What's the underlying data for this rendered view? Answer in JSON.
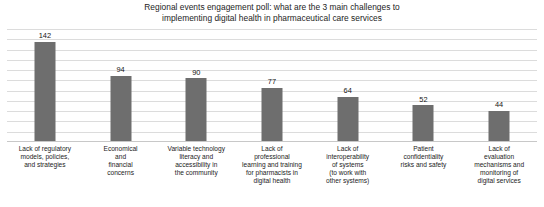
{
  "chart_data": {
    "type": "bar",
    "title": "Regional events engagement poll: what are the 3 main challenges to implementing digital health in pharmaceutical care services",
    "title_lines": [
      "Regional events engagement poll: what are the 3 main challenges to",
      "implementing digital health in pharmaceutical care services"
    ],
    "xlabel": "",
    "ylabel": "",
    "ylim": [
      0,
      160
    ],
    "grid": true,
    "gridline_count": 11,
    "legend": "none",
    "bar_color": "#6e6e6e",
    "gridline_color": "#dcdcdc",
    "categories": [
      "Lack of regulatory models, policies, and strategies",
      "Economical and financial concerns",
      "Variable technology literacy and accessibility in the community",
      "Lack of professional learning and training for pharmacists in digital health",
      "Lack of interoperability of systems (to work with other systems)",
      "Patient confidentiality risks and safety",
      "Lack of evaluation mechanisms and monitoring of digital services"
    ],
    "category_lines": [
      [
        "Lack of regulatory",
        "models, policies,",
        "and strategies"
      ],
      [
        "Economical",
        "and",
        "financial",
        "concerns"
      ],
      [
        "Variable technology",
        "literacy and",
        "accessibility in",
        "the community"
      ],
      [
        "Lack of",
        "professional",
        "learning and training",
        "for pharmacists in",
        "digital health"
      ],
      [
        "Lack of",
        "interoperability",
        "of systems",
        "(to work with",
        "other systems)"
      ],
      [
        "Patient",
        "confidentiality",
        "risks and safety"
      ],
      [
        "Lack of",
        "evaluation",
        "mechanisms and",
        "monitoring of",
        "digital services"
      ]
    ],
    "values": [
      142,
      94,
      90,
      77,
      64,
      52,
      44
    ],
    "value_labels": [
      "142",
      "94",
      "90",
      "77",
      "64",
      "52",
      "44"
    ]
  }
}
